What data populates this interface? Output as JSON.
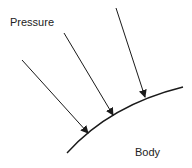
{
  "diagram": {
    "labels": {
      "pressure": "Pressure",
      "body": "Body"
    },
    "colors": {
      "stroke": "#1a1a1a",
      "text": "#222222",
      "background": "#ffffff"
    },
    "surface_curve": {
      "path": "M67,153 Q110,105 183,87"
    },
    "arrows": [
      {
        "x1": 22,
        "y1": 60,
        "x2": 88,
        "y2": 133
      },
      {
        "x1": 64,
        "y1": 33,
        "x2": 113,
        "y2": 115
      },
      {
        "x1": 116,
        "y1": 8,
        "x2": 145,
        "y2": 97
      }
    ]
  }
}
